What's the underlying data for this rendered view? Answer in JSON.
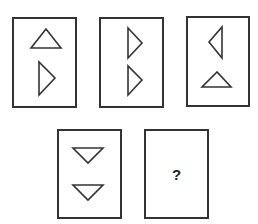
{
  "puzzle": {
    "stroke_color": "#333333",
    "background_color": "#ffffff",
    "panels": [
      {
        "id": "panel-1",
        "box": {
          "x": 13,
          "y": 18,
          "w": 63,
          "h": 89
        },
        "shapes": [
          {
            "type": "triangle",
            "direction": "up",
            "points": "46,29 31,48 61,48"
          },
          {
            "type": "triangle",
            "direction": "right",
            "points": "39,62 39,95 55,78"
          }
        ]
      },
      {
        "id": "panel-2",
        "box": {
          "x": 100,
          "y": 18,
          "w": 63,
          "h": 89
        },
        "shapes": [
          {
            "type": "triangle",
            "direction": "right",
            "points": "128,28 128,58 142,43"
          },
          {
            "type": "triangle",
            "direction": "right",
            "points": "128,66 128,95 142,80"
          }
        ]
      },
      {
        "id": "panel-3",
        "box": {
          "x": 187,
          "y": 17,
          "w": 62,
          "h": 89
        },
        "shapes": [
          {
            "type": "triangle",
            "direction": "left",
            "points": "222,27 222,58 209,42"
          },
          {
            "type": "triangle",
            "direction": "up",
            "points": "217,72 202,87 231,87"
          }
        ]
      },
      {
        "id": "panel-4",
        "box": {
          "x": 58,
          "y": 130,
          "w": 63,
          "h": 88
        },
        "shapes": [
          {
            "type": "triangle",
            "direction": "down",
            "points": "73,148 103,148 88,163"
          },
          {
            "type": "triangle",
            "direction": "down",
            "points": "73,185 103,185 88,200"
          }
        ]
      },
      {
        "id": "panel-5",
        "box": {
          "x": 145,
          "y": 130,
          "w": 63,
          "h": 88
        },
        "shapes": [],
        "label": "?"
      }
    ]
  }
}
